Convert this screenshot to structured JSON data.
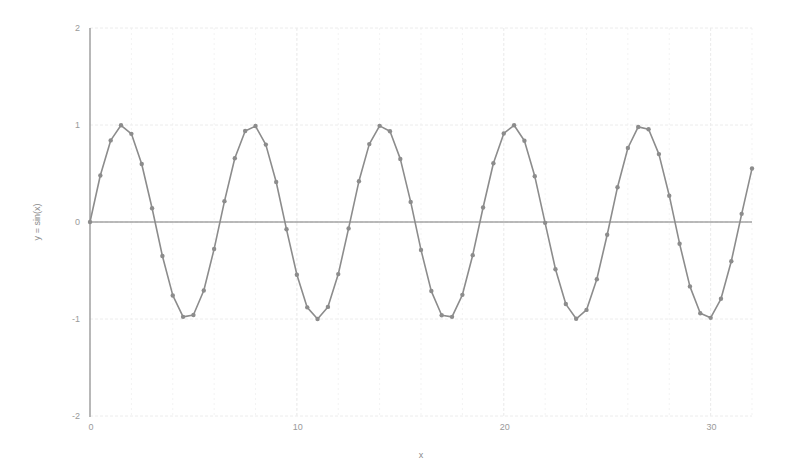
{
  "chart_data": {
    "type": "line",
    "title": "",
    "xlabel": "x",
    "ylabel": "y = sin(x)",
    "xlim": [
      0,
      32
    ],
    "ylim": [
      -2,
      2
    ],
    "x_ticks": [
      0,
      10,
      20,
      30
    ],
    "x_tick_labels": [
      "0",
      "10",
      "20",
      "30"
    ],
    "y_ticks": [
      2,
      1,
      0,
      -1,
      -2
    ],
    "y_tick_labels": [
      "2",
      "1",
      "0",
      "-1",
      "-2"
    ],
    "grid": true,
    "legend": null,
    "markers": true,
    "series": [
      {
        "name": "y = sin(x)",
        "color": "#8c8c8c",
        "x": [
          0,
          0.5,
          1,
          1.5,
          2,
          2.5,
          3,
          3.5,
          4,
          4.5,
          5,
          5.5,
          6,
          6.5,
          7,
          7.5,
          8,
          8.5,
          9,
          9.5,
          10,
          10.5,
          11,
          11.5,
          12,
          12.5,
          13,
          13.5,
          14,
          14.5,
          15,
          15.5,
          16,
          16.5,
          17,
          17.5,
          18,
          18.5,
          19,
          19.5,
          20,
          20.5,
          21,
          21.5,
          22,
          22.5,
          23,
          23.5,
          24,
          24.5,
          25,
          25.5,
          26,
          26.5,
          27,
          27.5,
          28,
          28.5,
          29,
          29.5,
          30,
          30.5,
          31,
          31.5,
          32
        ],
        "values": [
          0,
          0.479,
          0.841,
          0.997,
          0.909,
          0.598,
          0.141,
          -0.351,
          -0.757,
          -0.978,
          -0.959,
          -0.706,
          -0.279,
          0.215,
          0.657,
          0.938,
          0.989,
          0.798,
          0.412,
          -0.075,
          -0.544,
          -0.88,
          -1.0,
          -0.875,
          -0.537,
          -0.066,
          0.42,
          0.803,
          0.991,
          0.935,
          0.65,
          0.207,
          -0.288,
          -0.712,
          -0.961,
          -0.978,
          -0.751,
          -0.342,
          0.15,
          0.605,
          0.913,
          0.997,
          0.837,
          0.471,
          -0.009,
          -0.487,
          -0.846,
          -0.998,
          -0.906,
          -0.59,
          -0.132,
          0.359,
          0.763,
          0.98,
          0.956,
          0.7,
          0.271,
          -0.224,
          -0.664,
          -0.94,
          -0.988,
          -0.792,
          -0.404,
          0.084,
          0.551
        ]
      }
    ]
  },
  "zero_line_color": "#7a7a7a",
  "axis_color": "#a0a0a0",
  "grid_color": "#ececec"
}
